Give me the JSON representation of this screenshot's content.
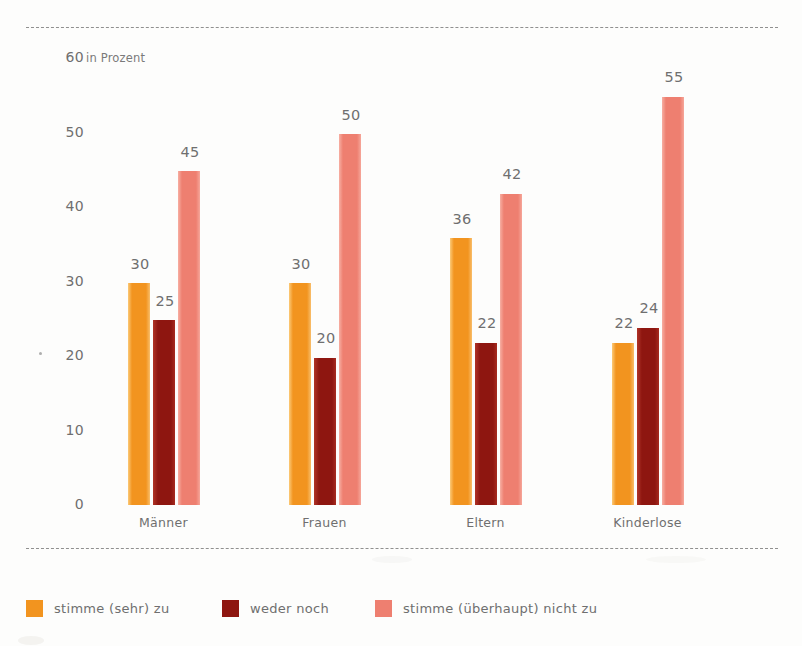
{
  "chart_data": {
    "type": "bar",
    "title": "",
    "subtitle": "",
    "xlabel": "",
    "ylabel": "",
    "unit_note": "in Prozent",
    "categories": [
      "Männer",
      "Frauen",
      "Eltern",
      "Kinderlose"
    ],
    "series": [
      {
        "name": "stimme (sehr) zu",
        "color": "#f2941f",
        "values": [
          30,
          30,
          36,
          22
        ]
      },
      {
        "name": "weder noch",
        "color": "#8e1610",
        "values": [
          25,
          20,
          22,
          24
        ]
      },
      {
        "name": "stimme (überhaupt) nicht zu",
        "color": "#ee7f70",
        "values": [
          45,
          50,
          42,
          55
        ]
      }
    ],
    "ylim": [
      0,
      60
    ],
    "yticks": [
      0,
      10,
      20,
      30,
      40,
      50,
      60
    ],
    "ytick_labels": [
      "0",
      "10",
      "20",
      "30",
      "40",
      "50",
      "60"
    ],
    "grid": false,
    "legend_position": "bottom",
    "value_labels": true
  },
  "axis": {
    "unit_note": "in Prozent",
    "ticks": [
      "60",
      "50",
      "40",
      "30",
      "20",
      "10",
      "0"
    ]
  },
  "groups": [
    {
      "label": "Männer",
      "bars": [
        {
          "series": "stimme (sehr) zu",
          "value": "30"
        },
        {
          "series": "weder noch",
          "value": "25"
        },
        {
          "series": "stimme (überhaupt) nicht zu",
          "value": "45"
        }
      ]
    },
    {
      "label": "Frauen",
      "bars": [
        {
          "series": "stimme (sehr) zu",
          "value": "30"
        },
        {
          "series": "weder noch",
          "value": "20"
        },
        {
          "series": "stimme (überhaupt) nicht zu",
          "value": "50"
        }
      ]
    },
    {
      "label": "Eltern",
      "bars": [
        {
          "series": "stimme (sehr) zu",
          "value": "36"
        },
        {
          "series": "weder noch",
          "value": "22"
        },
        {
          "series": "stimme (überhaupt) nicht zu",
          "value": "42"
        }
      ]
    },
    {
      "label": "Kinderlose",
      "bars": [
        {
          "series": "stimme (sehr) zu",
          "value": "22"
        },
        {
          "series": "weder noch",
          "value": "24"
        },
        {
          "series": "stimme (überhaupt) nicht zu",
          "value": "55"
        }
      ]
    }
  ],
  "legend": [
    {
      "label": "stimme (sehr) zu",
      "color": "#f2941f"
    },
    {
      "label": "weder noch",
      "color": "#8e1610"
    },
    {
      "label": "stimme (überhaupt) nicht zu",
      "color": "#ee7f70"
    }
  ]
}
